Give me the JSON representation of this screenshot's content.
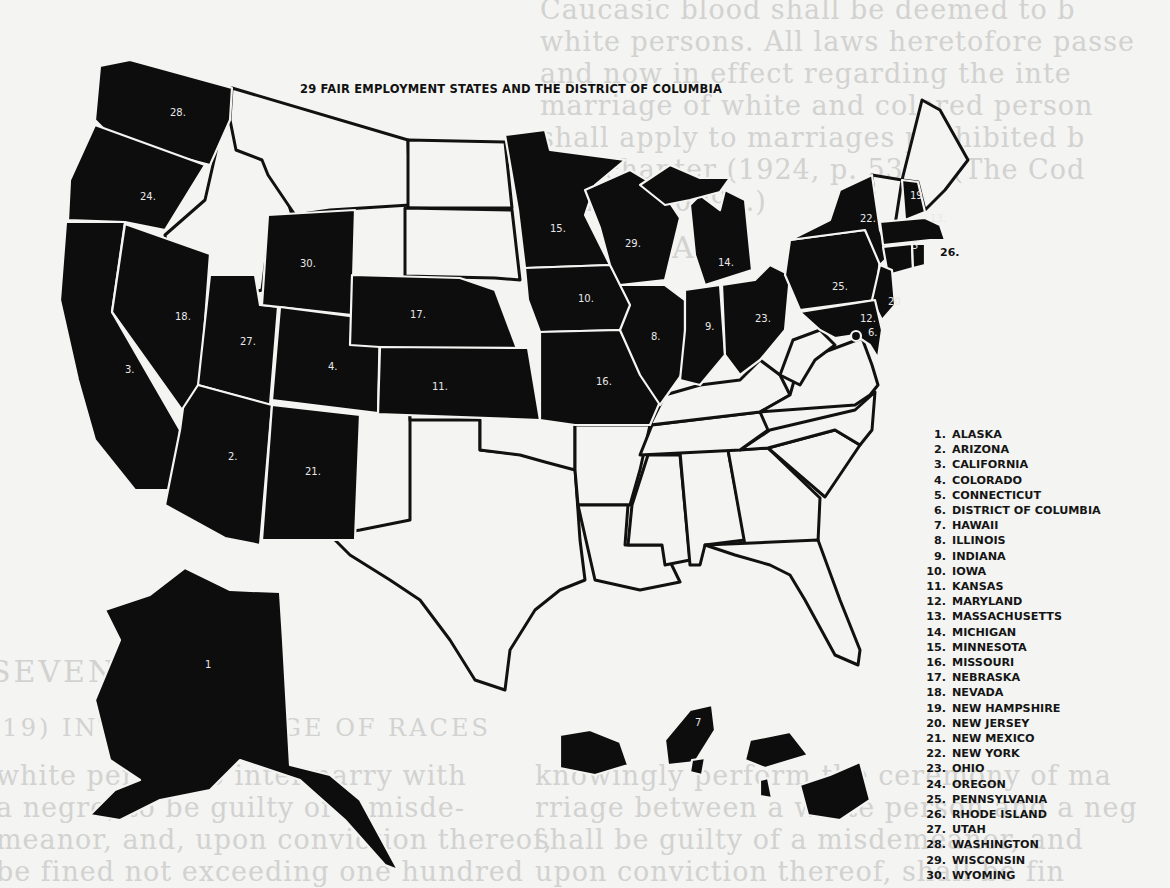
{
  "map": {
    "title": "29 FAIR EMPLOYMENT STATES AND THE DISTRICT OF COLUMBIA",
    "fair_employment_color": "#0d0d0d",
    "other_color": "#f4f4f2",
    "labels": {
      "washington": "28.",
      "oregon": "24.",
      "california": "3.",
      "nevada": "18.",
      "utah": "27.",
      "arizona": "2.",
      "wyoming": "30.",
      "colorado": "4.",
      "new_mexico": "21.",
      "nebraska": "17.",
      "kansas": "11.",
      "minnesota": "15.",
      "iowa": "10.",
      "missouri": "16.",
      "wisconsin": "29.",
      "illinois": "8.",
      "michigan": "14.",
      "indiana": "9.",
      "ohio": "23.",
      "pennsylvania": "25.",
      "new_york": "22.",
      "new_hampshire": "19.",
      "massachusetts": "13.",
      "connecticut": "5",
      "rhode_island": "26.",
      "new_jersey": "20",
      "maryland": "12.",
      "district_of_columbia": "6.",
      "alaska": "1",
      "hawaii": "7"
    },
    "legend": [
      {
        "num": "1.",
        "name": "ALASKA"
      },
      {
        "num": "2.",
        "name": "ARIZONA"
      },
      {
        "num": "3.",
        "name": "CALIFORNIA"
      },
      {
        "num": "4.",
        "name": "COLORADO"
      },
      {
        "num": "5.",
        "name": "CONNECTICUT"
      },
      {
        "num": "6.",
        "name": "DISTRICT OF COLUMBIA"
      },
      {
        "num": "7.",
        "name": "HAWAII"
      },
      {
        "num": "8.",
        "name": "ILLINOIS"
      },
      {
        "num": "9.",
        "name": "INDIANA"
      },
      {
        "num": "10.",
        "name": "IOWA"
      },
      {
        "num": "11.",
        "name": "KANSAS"
      },
      {
        "num": "12.",
        "name": "MARYLAND"
      },
      {
        "num": "13.",
        "name": "MASSACHUSETTS"
      },
      {
        "num": "14.",
        "name": "MICHIGAN"
      },
      {
        "num": "15.",
        "name": "MINNESOTA"
      },
      {
        "num": "16.",
        "name": "MISSOURI"
      },
      {
        "num": "17.",
        "name": "NEBRASKA"
      },
      {
        "num": "18.",
        "name": "NEVADA"
      },
      {
        "num": "19.",
        "name": "NEW HAMPSHIRE"
      },
      {
        "num": "20.",
        "name": "NEW JERSEY"
      },
      {
        "num": "21.",
        "name": "NEW MEXICO"
      },
      {
        "num": "22.",
        "name": "NEW YORK"
      },
      {
        "num": "23.",
        "name": "OHIO"
      },
      {
        "num": "24.",
        "name": "OREGON"
      },
      {
        "num": "25.",
        "name": "PENNSYLVANIA"
      },
      {
        "num": "26.",
        "name": "RHODE ISLAND"
      },
      {
        "num": "27.",
        "name": "UTAH"
      },
      {
        "num": "28.",
        "name": "WASHINGTON"
      },
      {
        "num": "29.",
        "name": "WISCONSIN"
      },
      {
        "num": "30.",
        "name": "WYOMING"
      }
    ]
  },
  "background_text": {
    "lines_left": [
      "Caucasic blood shall be deemed to b",
      "white persons. All laws heretofore passe",
      "and now in effect regarding the inte",
      "marriage of white and colored person",
      "shall apply to marriages prohibited b",
      "this chapter (1924, p. 536.) (The Cod",
      "1924, § 5099a.)"
    ],
    "lines_right": [
      "Caucasian person, or a person with",
      "no other admixture of blood than white",
      "and American Indian. For the purpose of",
      "this chapter, the term 'white person'",
      "shall apply only to such person as has no",
      "trace whatsoever of any blood other than",
      "Caucasian; but persons who have one-"
    ],
    "heading_1": "INTERMARRIAGE",
    "heading_2": "SEVENTH",
    "heading_3": "(19) INTERMARRIAGE OF RACES",
    "lower_lines": [
      "knowingly perform the ceremony of ma",
      "rriage between a white person and a neg",
      "shall be guilty of a misdemeanor, and",
      "upon conviction thereof, shall be fin"
    ],
    "lower_left_lines": [
      "white person to intermarry with",
      "a negro, to be guilty of a misde-",
      "meanor, and, upon conviction thereof,",
      "be fined not exceeding one hundred"
    ]
  }
}
